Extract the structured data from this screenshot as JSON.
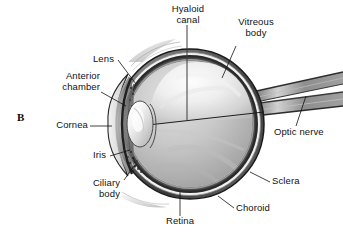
{
  "figure": {
    "panel_letter": "B",
    "background_color": "#ffffff",
    "ink_color": "#111111"
  },
  "labels": {
    "hyaloid_canal": "Hyaloid\ncanal",
    "vitreous_body": "Vitreous\nbody",
    "lens": "Lens",
    "anterior_chamber": "Anterior\nchamber",
    "cornea": "Cornea",
    "iris": "Iris",
    "ciliary_body": "Ciliary\nbody",
    "retina": "Retina",
    "choroid": "Choroid",
    "sclera": "Sclera",
    "optic_nerve": "Optic nerve"
  },
  "structures": [
    {
      "id": "hyaloid-canal",
      "name": "Hyaloid canal"
    },
    {
      "id": "vitreous-body",
      "name": "Vitreous body"
    },
    {
      "id": "lens",
      "name": "Lens"
    },
    {
      "id": "anterior-chamber",
      "name": "Anterior chamber"
    },
    {
      "id": "cornea",
      "name": "Cornea"
    },
    {
      "id": "iris",
      "name": "Iris"
    },
    {
      "id": "ciliary-body",
      "name": "Ciliary body"
    },
    {
      "id": "retina",
      "name": "Retina"
    },
    {
      "id": "choroid",
      "name": "Choroid"
    },
    {
      "id": "sclera",
      "name": "Sclera"
    },
    {
      "id": "optic-nerve",
      "name": "Optic nerve"
    }
  ]
}
